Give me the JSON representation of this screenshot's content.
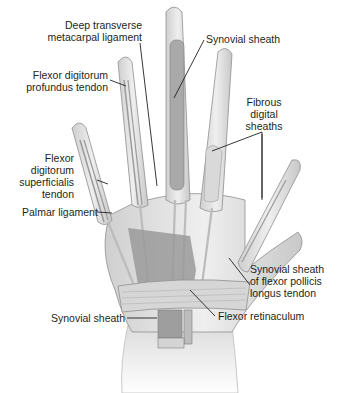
{
  "figure": {
    "colors": {
      "bone": "#e4e4e4",
      "bone_outline": "#8f8f8f",
      "sheath": "#a9a9a9",
      "tendon": "#cfcfcf",
      "aponeurosis": "#9a9a9a",
      "leader_line": "#231f20",
      "text": "#231f20"
    }
  },
  "labels": {
    "deep_transverse": [
      "Deep transverse",
      "metacarpal ligament"
    ],
    "synovial_sheath_top": "Synovial sheath",
    "fdp": [
      "Flexor digitorum",
      "profundus tendon"
    ],
    "fibrous": [
      "Fibrous",
      "digital",
      "sheaths"
    ],
    "fds": [
      "Flexor",
      "digitorum",
      "superficialis",
      "tendon"
    ],
    "palmar_ligament": "Palmar ligament",
    "fpl_sheath": [
      "Synovial sheath",
      "of flexor pollicis",
      "longus tendon"
    ],
    "synovial_sheath_bottom": "Synovial sheath",
    "flexor_retinaculum": "Flexor retinaculum"
  }
}
